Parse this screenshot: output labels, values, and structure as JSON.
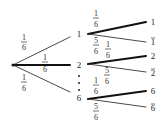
{
  "diagram": {
    "type": "probability-tree",
    "root": {
      "x": 13,
      "y": 65
    },
    "level1": {
      "branches": [
        {
          "label": "1",
          "prob_num": "1",
          "prob_den": "6"
        },
        {
          "label": "2",
          "prob_num": "1",
          "prob_den": "6"
        },
        {
          "label": "6",
          "prob_num": "1",
          "prob_den": "6"
        }
      ],
      "ellipsis": "⋮"
    },
    "level2": [
      {
        "parent": "1",
        "hit": {
          "label": "1",
          "prob_num": "1",
          "prob_den": "6"
        },
        "miss": {
          "label": "1",
          "overline": true,
          "prob_num": "5",
          "prob_den": "6"
        }
      },
      {
        "parent": "2",
        "hit": {
          "label": "2",
          "prob_num": "1",
          "prob_den": "6"
        },
        "miss": {
          "label": "2",
          "overline": true,
          "prob_num": "5",
          "prob_den": "6"
        }
      },
      {
        "parent": "6",
        "hit": {
          "label": "6",
          "prob_num": "1",
          "prob_den": "6"
        },
        "miss": {
          "label": "6",
          "overline": true,
          "prob_num": "5",
          "prob_den": "6"
        }
      }
    ]
  }
}
